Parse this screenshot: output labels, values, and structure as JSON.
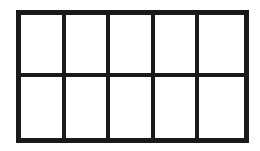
{
  "diagram": {
    "type": "rectangular grid",
    "rows": 2,
    "columns": 5,
    "cells": 10,
    "line_color": "#1a1a1a",
    "fill_color": "#ffffff"
  }
}
